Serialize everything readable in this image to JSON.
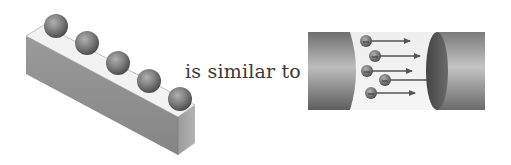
{
  "diagram": {
    "connector_text": "is similar to",
    "left_figure": {
      "description": "beads on a rectangular bar",
      "bead_count": 5
    },
    "right_figure": {
      "description": "charges flowing through a conductor between two cylinder segments",
      "particle_count": 5,
      "arrow_direction": "right"
    }
  },
  "colors": {
    "bar_top": "#f2f2f2",
    "bar_side_front": "#8e8e8e",
    "bar_side_end": "#a8a8a8",
    "bead": "#7a7a7a",
    "cylinder_dark": "#5a5a5a",
    "cylinder_light": "#b5b5b5",
    "arrow": "#555555",
    "text": "#3a3a3a"
  }
}
